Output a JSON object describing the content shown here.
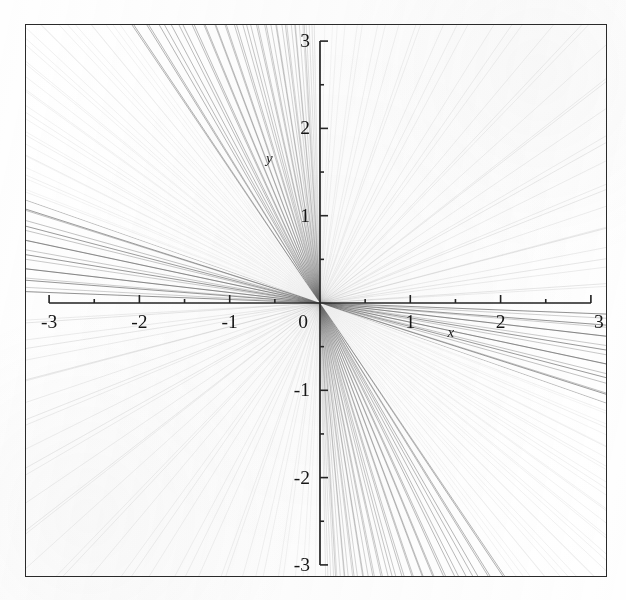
{
  "figure": {
    "background_color": "#fefefe",
    "frame_color": "#2a2a2a",
    "axis_color": "#1c1c1c",
    "line_color": "#6a6a6a",
    "label_color": "#151515"
  },
  "chart_data": {
    "type": "line",
    "title": "",
    "subtitle": "",
    "xlabel": "x",
    "ylabel": "y",
    "xlim": [
      -3,
      3
    ],
    "ylim": [
      -3,
      3
    ],
    "grid": false,
    "legend": null,
    "x_major_ticks": [
      -3,
      -2,
      -1,
      0,
      1,
      2,
      3
    ],
    "y_major_ticks": [
      -3,
      -2,
      -1,
      0,
      1,
      2,
      3
    ],
    "x_major_tick_labels": [
      "-3",
      "-2",
      "-1",
      "0",
      "1",
      "2",
      "3"
    ],
    "y_major_tick_labels": [
      "-3",
      "-2",
      "-1",
      "0",
      "1",
      "2",
      "3"
    ],
    "x_minor_tick_step": 0.5,
    "y_minor_tick_step": 0.5,
    "family": {
      "form": "y = m*x",
      "count": 64,
      "parameter_name": "m",
      "parameter_min": -40,
      "parameter_max": 40,
      "note": "Slopes sampled so density concentrates along the negative-slope directions."
    },
    "series": [
      {
        "name": "negative-slope family (dark)",
        "quadrants": [
          2,
          4
        ],
        "slopes": [
          -0.04,
          -0.08,
          -0.12,
          -0.17,
          -0.22,
          -0.27,
          -0.33,
          -0.39,
          -0.45,
          -0.52,
          -0.59,
          -0.67,
          -0.75,
          -0.84,
          -0.93,
          -1.03,
          -1.14,
          -1.26,
          -1.39,
          -1.53,
          -1.68,
          -1.85,
          -2.04,
          -2.25,
          -2.48,
          -2.74,
          -3.03,
          -3.36,
          -3.73,
          -4.15,
          -4.64,
          -5.2,
          -5.86,
          -6.63,
          -7.55,
          -8.66,
          -10.02,
          -11.72,
          -13.9,
          -16.8,
          -20.8,
          -26.6,
          -35.8,
          -50.0
        ],
        "opacity_start": 0.72,
        "opacity_end": 0.16
      },
      {
        "name": "positive-slope family (faint)",
        "quadrants": [
          1,
          3
        ],
        "slopes": [
          0.07,
          0.16,
          0.27,
          0.41,
          0.58,
          0.8,
          1.1,
          1.5,
          2.1,
          3.0,
          4.4,
          6.8,
          11.5,
          23.0,
          60.0
        ],
        "opacity_start": 0.2,
        "opacity_end": 0.07
      }
    ]
  },
  "labels": {
    "x_axis_variable": "x",
    "y_axis_variable": "y"
  },
  "geometry": {
    "origin_x_px": 320,
    "origin_y_px": 303,
    "unit_x_px": 90.3,
    "unit_y_px": 87.3,
    "frame_left_px": 25,
    "frame_top_px": 24,
    "frame_width_px": 582,
    "frame_height_px": 553
  }
}
